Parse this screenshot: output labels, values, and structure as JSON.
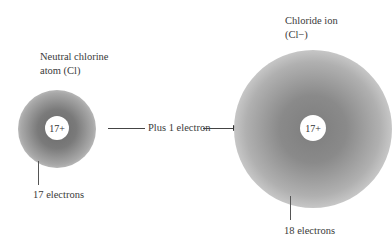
{
  "diagram": {
    "left_atom": {
      "title_line1": "Neutral chlorine",
      "title_line2": "atom (Cl)",
      "nucleus_charge": "17+",
      "electron_label": "17 electrons"
    },
    "transition": {
      "label": "Plus 1 electron"
    },
    "right_atom": {
      "title_line1": "Chloride ion",
      "title_line2": "(Cl−)",
      "nucleus_charge": "17+",
      "electron_label": "18 electrons"
    }
  }
}
